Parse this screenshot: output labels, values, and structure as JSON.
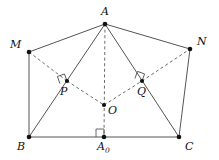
{
  "figure": {
    "canvas": {
      "width": 219,
      "height": 160
    },
    "stroke_colors": {
      "solid_edge": "#545454",
      "dashed_edge": "#6b6b6b",
      "vertex_dot": "#111111",
      "angle_mark": "#5a5a5a",
      "background": "#ffffff"
    },
    "points": [
      {
        "id": "A",
        "label": "A",
        "x": 105,
        "y": 24,
        "label_x": 101,
        "label_y": 6,
        "dot_r": 2.3
      },
      {
        "id": "M",
        "label": "M",
        "x": 29,
        "y": 52,
        "label_x": 10,
        "label_y": 39,
        "dot_r": 2.3
      },
      {
        "id": "N",
        "label": "N",
        "x": 190,
        "y": 49,
        "label_x": 197,
        "label_y": 36,
        "dot_r": 2.3
      },
      {
        "id": "P",
        "label": "P",
        "x": 67,
        "y": 81,
        "label_x": 60,
        "label_y": 86,
        "dot_r": 2.1
      },
      {
        "id": "Q",
        "label": "Q",
        "x": 142,
        "y": 81,
        "label_x": 137,
        "label_y": 86,
        "dot_r": 2.1
      },
      {
        "id": "O",
        "label": "O",
        "x": 104,
        "y": 105,
        "label_x": 108,
        "label_y": 105,
        "dot_r": 2.1
      },
      {
        "id": "B",
        "label": "B",
        "x": 29,
        "y": 137,
        "label_x": 17,
        "label_y": 141,
        "dot_r": 2.3
      },
      {
        "id": "C",
        "label": "C",
        "x": 179,
        "y": 137,
        "label_x": 185,
        "label_y": 141,
        "dot_r": 2.3
      },
      {
        "id": "A0",
        "label": "A",
        "sub": "0",
        "x": 104,
        "y": 137,
        "label_x": 97,
        "label_y": 141,
        "dot_r": 2.3
      }
    ],
    "edges_solid": [
      {
        "id": "A-M",
        "from": "A",
        "to": "M"
      },
      {
        "id": "A-N",
        "from": "A",
        "to": "N"
      },
      {
        "id": "A-B",
        "from": "A",
        "to": "B"
      },
      {
        "id": "A-C",
        "from": "A",
        "to": "C"
      },
      {
        "id": "M-B",
        "from": "M",
        "to": "B"
      },
      {
        "id": "N-C",
        "from": "N",
        "to": "C"
      },
      {
        "id": "B-C",
        "from": "B",
        "to": "C"
      }
    ],
    "edges_dashed": [
      {
        "id": "M-P",
        "from": "M",
        "to": "P"
      },
      {
        "id": "P-O",
        "from": "P",
        "to": "O"
      },
      {
        "id": "O-Q",
        "from": "O",
        "to": "Q"
      },
      {
        "id": "Q-N",
        "from": "Q",
        "to": "N"
      },
      {
        "id": "A-A0",
        "from": "A",
        "to": "A0"
      }
    ],
    "right_angle_marks": [
      {
        "id": "angle-at-P",
        "at": "P",
        "size": 7.5,
        "rotation_deg": -20
      },
      {
        "id": "angle-at-Q",
        "at": "Q",
        "size": 7.5,
        "rotation_deg": 20
      },
      {
        "id": "angle-at-A0",
        "at": "A0",
        "size": 8,
        "rotation_deg": 0
      }
    ]
  }
}
